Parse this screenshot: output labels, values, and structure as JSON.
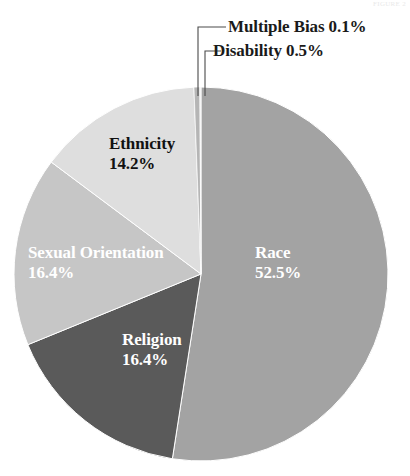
{
  "page": {
    "artifact_text": "FIGURE 2"
  },
  "chart_data": {
    "type": "pie",
    "title": "",
    "subtitle": "",
    "xlabel": "",
    "ylabel": "",
    "legend_position": "none",
    "grid": false,
    "start_angle_deg": 0,
    "direction": "clockwise",
    "units": "percent",
    "categories": [
      "Race",
      "Religion",
      "Sexual Orientation",
      "Ethnicity",
      "Disability",
      "Multiple Bias"
    ],
    "values": [
      52.5,
      16.4,
      16.4,
      14.2,
      0.5,
      0.1
    ],
    "slices": [
      {
        "name": "Race",
        "label": "Race",
        "percent": "52.5%",
        "value": 52.5,
        "color": "#a3a3a3",
        "label_placement": "inside",
        "label_color": "#ffffff"
      },
      {
        "name": "Religion",
        "label": "Religion",
        "percent": "16.4%",
        "value": 16.4,
        "color": "#5a5a5a",
        "label_placement": "inside",
        "label_color": "#ffffff"
      },
      {
        "name": "Sexual Orientation",
        "label": "Sexual Orientation",
        "percent": "16.4%",
        "value": 16.4,
        "color": "#c6c6c6",
        "label_placement": "inside",
        "label_color": "#ffffff"
      },
      {
        "name": "Ethnicity",
        "label": "Ethnicity",
        "percent": "14.2%",
        "value": 14.2,
        "color": "#dedede",
        "label_placement": "inside",
        "label_color": "#111111"
      },
      {
        "name": "Disability",
        "label": "Disability",
        "percent": "0.5%",
        "value": 0.5,
        "color": "#b5b5b5",
        "label_placement": "callout",
        "label_color": "#1a1a1a",
        "callout_text": "Disability 0.5%"
      },
      {
        "name": "Multiple Bias",
        "label": "Multiple Bias",
        "percent": "0.1%",
        "value": 0.1,
        "color": "#efefef",
        "label_placement": "callout",
        "label_color": "#1a1a1a",
        "callout_text": "Multiple Bias 0.1%"
      }
    ]
  },
  "geometry": {
    "center_x": 201,
    "center_y": 274,
    "radius": 187
  }
}
